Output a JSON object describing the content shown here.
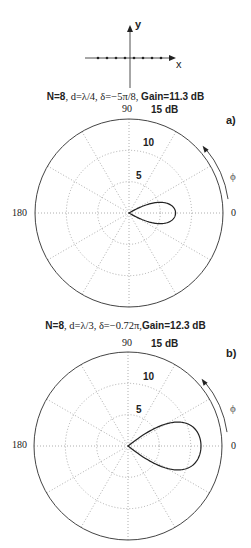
{
  "inset": {
    "x_label": "x",
    "y_label": "y",
    "element_count": 8
  },
  "plots": [
    {
      "id": "a",
      "panel_label": "a)",
      "title": {
        "n": "N=8",
        "params": ", d=λ/4, δ=−5π/8, ",
        "gain": "Gain=11.3 dB"
      },
      "angle_labels": {
        "top": "90",
        "left": "180",
        "right": "0"
      },
      "scale_max": "15 dB",
      "ring_labels": [
        "5",
        "10"
      ],
      "phi": "ϕ",
      "N": 8,
      "d_over_lambda": 0.25,
      "delta_over_pi": -0.625,
      "gain_db": 11.3
    },
    {
      "id": "b",
      "panel_label": "b)",
      "title": {
        "n": "N=8",
        "params": ", d=λ/3, δ=−0.72π,",
        "gain": "Gain=12.3 dB"
      },
      "angle_labels": {
        "top": "90",
        "left": "180",
        "right": "0"
      },
      "scale_max": "15 dB",
      "ring_labels": [
        "5",
        "10"
      ],
      "phi": "ϕ",
      "N": 8,
      "d_over_lambda": 0.3333,
      "delta_over_pi": -0.72,
      "gain_db": 12.3
    }
  ],
  "chart_data": [
    {
      "type": "polar",
      "title": "N=8, d=λ/4, δ=−5π/8, Gain=11.3 dB",
      "panel": "a)",
      "radial_unit": "dB",
      "radial_ticks": [
        5,
        10,
        15
      ],
      "radial_range": [
        0,
        15
      ],
      "angle_ticks_deg": [
        0,
        90,
        180
      ],
      "angular_grid_step_deg": 30,
      "grid": true,
      "series": [
        {
          "name": "array pattern",
          "peak_direction_deg": 0,
          "peak_db": 11.3,
          "sidelobes_deg": [
            60,
            -60
          ]
        }
      ]
    },
    {
      "type": "polar",
      "title": "N=8, d=λ/3, δ=−0.72π, Gain=12.3 dB",
      "panel": "b)",
      "radial_unit": "dB",
      "radial_ticks": [
        5,
        10,
        15
      ],
      "radial_range": [
        0,
        15
      ],
      "angle_ticks_deg": [
        0,
        90,
        180
      ],
      "angular_grid_step_deg": 30,
      "grid": true,
      "series": [
        {
          "name": "array pattern",
          "peak_direction_deg": 0,
          "peak_db": 12.3
        }
      ]
    }
  ]
}
